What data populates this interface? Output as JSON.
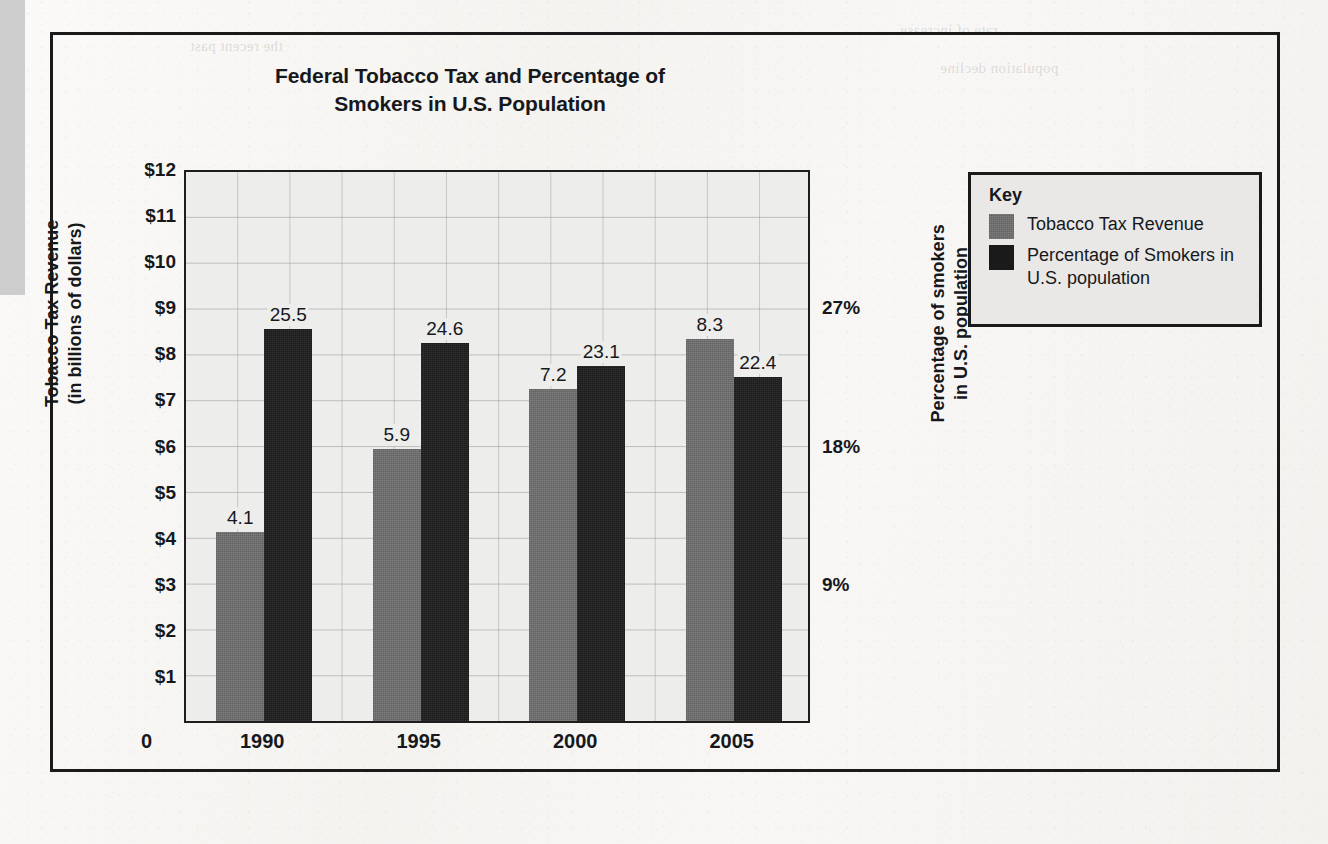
{
  "figure": {
    "title": "Federal Tobacco Tax and Percentage of Smokers in U.S. Population",
    "title_line1": "Federal Tobacco Tax and Percentage of",
    "title_line2": "Smokers in U.S. Population"
  },
  "legend": {
    "heading": "Key",
    "entries": [
      {
        "label": "Tobacco Tax Revenue",
        "color": "#6e6e6e",
        "swatch": "revenue"
      },
      {
        "label": "Percentage of Smokers in U.S. population",
        "color": "#1a1a1a",
        "swatch": "smokers"
      }
    ]
  },
  "axes": {
    "left_title_line1": "Tobacco Tax Revenue",
    "left_title_line2": "(in billions of dollars)",
    "right_title_line1": "Percentage of smokers",
    "right_title_line2": "in U.S. population",
    "left_ticks": [
      "$12",
      "$11",
      "$10",
      "$9",
      "$8",
      "$7",
      "$6",
      "$5",
      "$4",
      "$3",
      "$2",
      "$1"
    ],
    "left_values": [
      12,
      11,
      10,
      9,
      8,
      7,
      6,
      5,
      4,
      3,
      2,
      1
    ],
    "origin_label": "0",
    "right_ticks": [
      "27%",
      "18%",
      "9%"
    ],
    "right_values": [
      27,
      18,
      9
    ]
  },
  "chart_data": {
    "type": "bar",
    "title": "Federal Tobacco Tax and Percentage of Smokers in U.S. Population",
    "xlabel": "",
    "ylabel": "Tobacco Tax Revenue (in billions of dollars)",
    "y2label": "Percentage of smokers in U.S. population",
    "categories": [
      "1990",
      "1995",
      "2000",
      "2005"
    ],
    "ylim": [
      0,
      12
    ],
    "y2lim": [
      0,
      36
    ],
    "grid": true,
    "legend_position": "right-outside",
    "series": [
      {
        "name": "Tobacco Tax Revenue",
        "axis": "left",
        "unit": "billions of dollars",
        "color": "#6e6e6e",
        "values": [
          4.1,
          5.9,
          7.2,
          8.3
        ],
        "labels": [
          "4.1",
          "5.9",
          "7.2",
          "8.3"
        ]
      },
      {
        "name": "Percentage of Smokers in U.S. population",
        "axis": "right",
        "unit": "percent",
        "color": "#1a1a1a",
        "values": [
          25.5,
          24.6,
          23.1,
          22.4
        ],
        "labels": [
          "25.5",
          "24.6",
          "23.1",
          "22.4"
        ]
      }
    ]
  }
}
